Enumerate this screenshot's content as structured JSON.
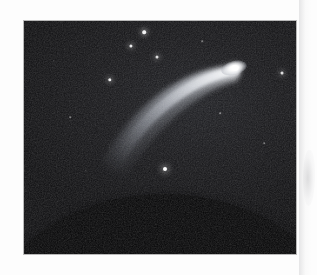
{
  "page": {
    "background_color": "#fdfdfd",
    "kind": "scanned-photograph-page",
    "scan_artifact": "faint gray shadow band along right margin"
  },
  "photograph": {
    "name": "comet-photograph",
    "subject": "comet with curved dust tail above a planetary limb",
    "frame": {
      "x": 23,
      "y": 20,
      "width": 274,
      "height": 235,
      "border_color": "#b9b9b9",
      "background_color": "#0b0b0d"
    },
    "sky": {
      "description": "grainy dark night sky, slightly brighter toward upper right",
      "base_color": "#0b0b0d",
      "glow_color": "#1c1d21",
      "grain": "heavy film grain"
    },
    "comet": {
      "name": "comet",
      "head": {
        "label": "comet nucleus and coma",
        "x": 210,
        "y": 47,
        "width": 26,
        "height": 14,
        "color": "#ffffff",
        "rotation_deg": -14
      },
      "core": {
        "label": "bright nucleus",
        "x": 211,
        "y": 47,
        "width": 7,
        "height": 6,
        "color": "#ffffff"
      },
      "tail": {
        "label": "curved dust tail",
        "color": "#cfd3da",
        "description": "broad arc sweeping from the head down and to the left, fanning wider and fading out",
        "path": "M 213 49 C 170 52, 120 80, 86 140",
        "start": {
          "x": 213,
          "y": 49
        },
        "end": {
          "x": 86,
          "y": 140
        },
        "start_width": 5,
        "end_width": 26
      }
    },
    "limb": {
      "name": "earth-limb",
      "label": "dark curved limb of the Earth",
      "color": "#030304",
      "apex_y": 178,
      "edge_y": 196
    },
    "stars": [
      {
        "name": "star-1",
        "x": 120,
        "y": 11,
        "size": 3.6,
        "brightness": 0.95
      },
      {
        "name": "star-2",
        "x": 107,
        "y": 25,
        "size": 3.2,
        "brightness": 0.9
      },
      {
        "name": "star-3",
        "x": 133,
        "y": 36,
        "size": 3.0,
        "brightness": 0.85
      },
      {
        "name": "star-4",
        "x": 86,
        "y": 59,
        "size": 3.4,
        "brightness": 0.92
      },
      {
        "name": "star-5",
        "x": 258,
        "y": 52,
        "size": 3.0,
        "brightness": 0.85
      },
      {
        "name": "star-6",
        "x": 141,
        "y": 148,
        "size": 4.0,
        "brightness": 1.0
      },
      {
        "name": "star-7",
        "x": 196,
        "y": 92,
        "size": 1.6,
        "brightness": 0.45
      },
      {
        "name": "star-8",
        "x": 46,
        "y": 96,
        "size": 1.5,
        "brightness": 0.4
      },
      {
        "name": "star-9",
        "x": 240,
        "y": 122,
        "size": 1.5,
        "brightness": 0.38
      },
      {
        "name": "star-10",
        "x": 62,
        "y": 150,
        "size": 1.4,
        "brightness": 0.35
      },
      {
        "name": "star-11",
        "x": 178,
        "y": 20,
        "size": 1.5,
        "brightness": 0.4
      },
      {
        "name": "star-12",
        "x": 30,
        "y": 40,
        "size": 1.4,
        "brightness": 0.35
      }
    ]
  }
}
